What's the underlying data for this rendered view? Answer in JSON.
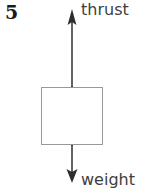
{
  "figure": {
    "question_number": "5",
    "background_color": "#ffffff",
    "width": 153,
    "height": 190
  },
  "diagram": {
    "type": "free-body-force-diagram",
    "body": {
      "shape": "rectangle",
      "stroke_color": "#9a9a9a",
      "fill_color": "#ffffff",
      "x": 41,
      "y": 87,
      "width": 62,
      "height": 58
    },
    "forces": [
      {
        "name": "thrust",
        "label": "thrust",
        "direction": "up",
        "label_color": "#404040",
        "arrow_color": "#3c3c3c",
        "tail_y": 145,
        "head_y": 10,
        "axis_x": 72
      },
      {
        "name": "weight",
        "label": "weight",
        "direction": "down",
        "label_color": "#404040",
        "arrow_color": "#3c3c3c",
        "tail_y": 87,
        "head_y": 182,
        "axis_x": 72
      }
    ]
  }
}
